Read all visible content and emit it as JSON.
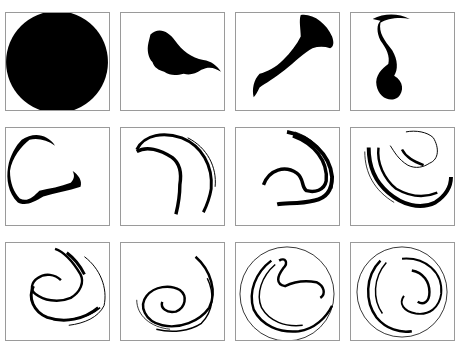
{
  "figure": {
    "caption": "",
    "layout": {
      "rows": 3,
      "cols": 4
    },
    "panels": [
      {
        "id": 1,
        "description": "filled black disk"
      },
      {
        "id": 2,
        "description": "blob stretching to the right"
      },
      {
        "id": 3,
        "description": "elongated trumpet-shaped filament"
      },
      {
        "id": 4,
        "description": "S-shaped vertical filament"
      },
      {
        "id": 5,
        "description": "C-shaped curl"
      },
      {
        "id": 6,
        "description": "hooked arc with thin tail"
      },
      {
        "id": 7,
        "description": "spiral arms forming"
      },
      {
        "id": 8,
        "description": "folded spiral layers"
      },
      {
        "id": 9,
        "description": "multi-layer spiral"
      },
      {
        "id": 10,
        "description": "tightly wound spiral"
      },
      {
        "id": 11,
        "description": "large circular wrapped spiral"
      },
      {
        "id": 12,
        "description": "nearly circular mixed filaments"
      }
    ]
  }
}
